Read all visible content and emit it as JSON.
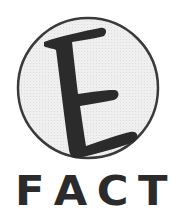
{
  "logo": {
    "emblem_letter": "E",
    "wordmark": [
      "F",
      "A",
      "C",
      "T"
    ],
    "colors": {
      "ink": "#2b2b2b",
      "circle_fill": "#ececec",
      "circle_stroke": "#3a3a3a",
      "background": "#ffffff"
    }
  }
}
